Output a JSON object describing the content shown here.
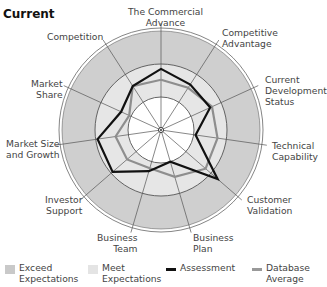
{
  "title": "Current",
  "labels": [
    [
      "The Commercial",
      "Advance"
    ],
    [
      "Competitive",
      "Advantage"
    ],
    [
      "Current",
      "Development",
      "Status"
    ],
    [
      "Technical",
      "Capability"
    ],
    [
      "Customer",
      "Validation"
    ],
    [
      "Business",
      "Plan"
    ],
    [
      "Business",
      "Team"
    ],
    [
      "Investor",
      "Support"
    ],
    [
      "Market Size",
      "and Growth"
    ],
    [
      "Market",
      "Share"
    ],
    [
      "Competition"
    ]
  ],
  "legend": {
    "exceed": [
      "Exceed",
      "Expectations"
    ],
    "meet": [
      "Meet",
      "Expectations"
    ],
    "assessment": [
      "Assessment"
    ],
    "database": [
      "Database",
      "Average"
    ]
  },
  "colors": {
    "exceed_band": "#cfcfcf",
    "meet_band": "#e6e6e6",
    "inner": "#ffffff",
    "assessment": "#111111",
    "database": "#8e8e8e",
    "grid": "#555555"
  },
  "chart_data": {
    "type": "radar",
    "title": "Current",
    "categories": [
      "The Commercial Advance",
      "Competitive Advantage",
      "Current Development Status",
      "Technical Capability",
      "Customer Validation",
      "Business Plan",
      "Business Team",
      "Investor Support",
      "Market Size and Growth",
      "Market Share",
      "Competition"
    ],
    "bands": [
      {
        "name": "Below Expectations",
        "range": [
          0,
          1
        ]
      },
      {
        "name": "Meet Expectations",
        "range": [
          1,
          2
        ]
      },
      {
        "name": "Exceed Expectations",
        "range": [
          2,
          3
        ]
      }
    ],
    "rlim": [
      0,
      3
    ],
    "series": [
      {
        "name": "Assessment",
        "values": [
          1.85,
          1.64,
          1.64,
          1.06,
          2.27,
          1.0,
          1.3,
          1.94,
          1.94,
          1.33,
          1.58
        ]
      },
      {
        "name": "Database Average",
        "values": [
          1.52,
          1.52,
          1.7,
          1.73,
          1.79,
          1.48,
          1.21,
          1.36,
          1.39,
          1.06,
          1.58
        ]
      }
    ],
    "legend_position": "bottom"
  }
}
